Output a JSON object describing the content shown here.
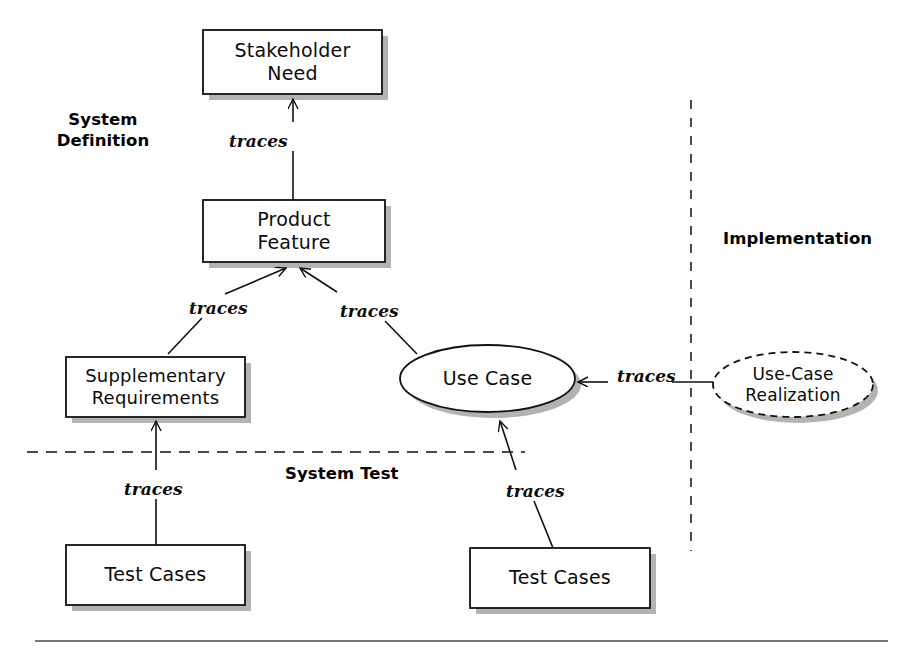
{
  "diagram": {
    "type": "traceability-diagram",
    "background_color": "#ffffff",
    "stroke_color": "#111111",
    "shadow_color": "#8a8a8a",
    "nodes": [
      {
        "id": "stakeholder-need",
        "label": "Stakeholder\nNeed",
        "shape": "rectangle",
        "x": 203,
        "y": 30,
        "w": 179,
        "h": 64
      },
      {
        "id": "product-feature",
        "label": "Product\nFeature",
        "shape": "rectangle",
        "x": 203,
        "y": 200,
        "w": 182,
        "h": 62
      },
      {
        "id": "supplementary-requirements",
        "label": "Supplementary\nRequirements",
        "shape": "rectangle",
        "x": 66,
        "y": 357,
        "w": 179,
        "h": 60
      },
      {
        "id": "use-case",
        "label": "Use Case",
        "shape": "ellipse",
        "x": 400,
        "y": 345,
        "w": 175,
        "h": 67
      },
      {
        "id": "use-case-realization",
        "label": "Use-Case\nRealization",
        "shape": "ellipse-dashed",
        "x": 713,
        "y": 352,
        "w": 160,
        "h": 65
      },
      {
        "id": "test-cases-left",
        "label": "Test Cases",
        "shape": "rectangle",
        "x": 66,
        "y": 545,
        "w": 179,
        "h": 60
      },
      {
        "id": "test-cases-right",
        "label": "Test Cases",
        "shape": "rectangle",
        "x": 470,
        "y": 548,
        "w": 180,
        "h": 60
      }
    ],
    "edges": [
      {
        "id": "feature-to-need",
        "label": "traces",
        "from": "product-feature",
        "to": "stakeholder-need",
        "label_x": 229,
        "label_y": 131
      },
      {
        "id": "supp-to-feature",
        "label": "traces",
        "from": "supplementary-requirements",
        "to": "product-feature",
        "label_x": 189,
        "label_y": 298
      },
      {
        "id": "usecase-to-feature",
        "label": "traces",
        "from": "use-case",
        "to": "product-feature",
        "label_x": 340,
        "label_y": 301
      },
      {
        "id": "realization-to-usecase",
        "label": "traces",
        "from": "use-case-realization",
        "to": "use-case",
        "label_x": 617,
        "label_y": 366
      },
      {
        "id": "testcases-left-to-supp",
        "label": "traces",
        "from": "test-cases-left",
        "to": "supplementary-requirements",
        "label_x": 124,
        "label_y": 479
      },
      {
        "id": "testcases-right-to-usecase",
        "label": "traces",
        "from": "test-cases-right",
        "to": "use-case",
        "label_x": 506,
        "label_y": 481
      }
    ],
    "zones": [
      {
        "id": "system-definition",
        "label": "System\nDefinition",
        "x": 43,
        "y": 110
      },
      {
        "id": "implementation",
        "label": "Implementation",
        "x": 723,
        "y": 229
      },
      {
        "id": "system-test",
        "label": "System Test",
        "x": 285,
        "y": 464
      }
    ],
    "dividers": [
      {
        "id": "system-test-divider",
        "orientation": "horizontal",
        "style": "dashed",
        "x1": 27,
        "y1": 452,
        "x2": 525,
        "y2": 452
      },
      {
        "id": "implementation-divider",
        "orientation": "vertical",
        "style": "dashed",
        "x1": 691,
        "y1": 100,
        "x2": 691,
        "y2": 551
      },
      {
        "id": "bottom-rule",
        "orientation": "horizontal",
        "style": "solid",
        "x1": 35,
        "y1": 641,
        "x2": 888,
        "y2": 641
      }
    ]
  }
}
